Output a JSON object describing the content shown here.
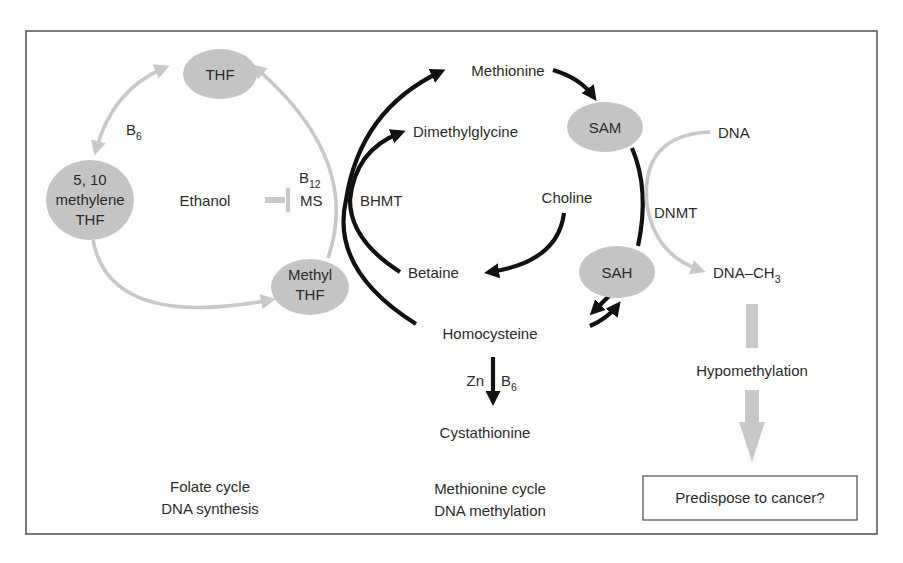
{
  "colors": {
    "node_fill": "#c4c4c4",
    "folate_arrows": "#c8c8c8",
    "methionine_arrows": "#111111",
    "frame": "#5a5a5a",
    "text": "#2b2b2b"
  },
  "folate_cycle": {
    "nodes": {
      "thf": "THF",
      "methylene_line1": "5, 10",
      "methylene_line2": "methylene",
      "methylene_line3": "THF",
      "methyl_line1": "Methyl",
      "methyl_line2": "THF"
    },
    "cofactor_b6": {
      "base": "B",
      "sub": "6"
    },
    "cofactor_b12": {
      "base": "B",
      "sub": "12"
    },
    "enzyme_ms": "MS",
    "inhibitor": "Ethanol",
    "caption_line1": "Folate cycle",
    "caption_line2": "DNA synthesis"
  },
  "methionine_cycle": {
    "metabolites": {
      "methionine": "Methionine",
      "dimethylglycine": "Dimethylglycine",
      "choline": "Choline",
      "betaine": "Betaine",
      "homocysteine": "Homocysteine",
      "cystathionine": "Cystathionine"
    },
    "nodes": {
      "sam": "SAM",
      "sah": "SAH"
    },
    "enzyme_bhmt": "BHMT",
    "cofactor_zn": "Zn",
    "cofactor_b6": {
      "base": "B",
      "sub": "6"
    },
    "caption_line1": "Methionine cycle",
    "caption_line2": "DNA methylation"
  },
  "dna_methylation": {
    "dna": "DNA",
    "enzyme_dnmt": "DNMT",
    "dna_ch3": {
      "base": "DNA–CH",
      "sub": "3"
    },
    "hypomethylation": "Hypomethylation",
    "outcome": "Predispose to cancer?"
  }
}
